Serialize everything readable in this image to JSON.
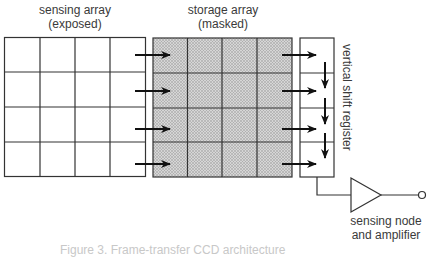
{
  "diagram": {
    "sensing_array": {
      "title": "sensing array",
      "subtitle": "(exposed)",
      "rows": 4,
      "cols": 4,
      "fill": "#ffffff"
    },
    "storage_array": {
      "title": "storage array",
      "subtitle": "(masked)",
      "rows": 4,
      "cols": 4,
      "fill": "#c9c9c9"
    },
    "shift_register": {
      "label": "vertical shift register",
      "cells": 4
    },
    "amplifier": {
      "line1": "sensing node",
      "line2": "and amplifier"
    },
    "caption": "Figure 3. Frame-transfer CCD architecture",
    "colors": {
      "stroke": "#333333",
      "text": "#3a3a3a",
      "arrow": "#111111"
    }
  }
}
